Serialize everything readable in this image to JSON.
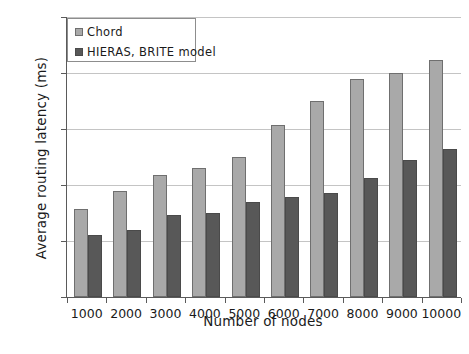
{
  "chart_data": {
    "type": "bar",
    "title": "",
    "xlabel": "Number of nodes",
    "ylabel": "Average routing latency (ms)",
    "categories": [
      "1000",
      "2000",
      "3000",
      "4000",
      "5000",
      "6000",
      "7000",
      "8000",
      "9000",
      "10000"
    ],
    "series": [
      {
        "name": "Chord",
        "color": "#a9a9a9",
        "values": [
          790,
          950,
          1090,
          1150,
          1250,
          1540,
          1750,
          1950,
          2000,
          2120
        ]
      },
      {
        "name": "HIERAS, BRITE model",
        "color": "#585858",
        "values": [
          555,
          595,
          730,
          750,
          845,
          890,
          930,
          1065,
          1225,
          1320
        ]
      }
    ],
    "ylim": [
      0,
      2500
    ],
    "yticks": [
      0,
      500,
      1000,
      1500,
      2000,
      2500
    ],
    "ytick_labels": [
      "0",
      "500",
      "1000",
      "1500",
      "2000",
      "2500"
    ],
    "grid": "horizontal",
    "legend_position": "top-left",
    "legend_entries": [
      "Chord",
      "HIERAS, BRITE model"
    ]
  }
}
